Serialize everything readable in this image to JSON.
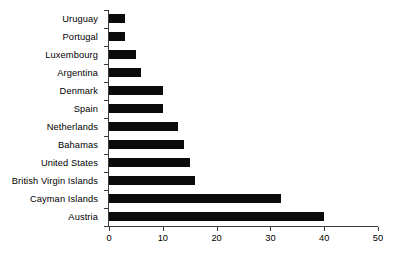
{
  "chart_data": {
    "type": "bar",
    "orientation": "horizontal",
    "title": "",
    "subtitle": "",
    "xlabel": "",
    "ylabel": "",
    "categories": [
      "Uruguay",
      "Portugal",
      "Luxembourg",
      "Argentina",
      "Denmark",
      "Spain",
      "Netherlands",
      "Bahamas",
      "United States",
      "British Virgin Islands",
      "Cayman Islands",
      "Austria"
    ],
    "values": [
      3,
      3,
      5,
      6,
      10,
      10,
      12.8,
      14,
      15,
      16,
      32,
      40
    ],
    "xlim": [
      0,
      50
    ],
    "xticks": [
      0,
      10,
      20,
      30,
      40,
      50
    ],
    "xtick_labels": [
      "0",
      "10",
      "20",
      "30",
      "40",
      "50"
    ],
    "grid": false,
    "legend": null,
    "bar_color": "#0b0b0b",
    "axis_color": "#3a3a3a",
    "background_color": "#ffffff"
  }
}
